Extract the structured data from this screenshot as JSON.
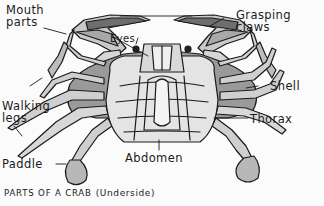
{
  "diagram": {
    "title": "PARTS OF A CRAB",
    "subtitle": "(Underside)",
    "labels": [
      {
        "id": "mouth-parts",
        "line1": "Mouth",
        "line2": "parts"
      },
      {
        "id": "eyes",
        "line1": "Eyes"
      },
      {
        "id": "grasping-claws",
        "line1": "Grasping",
        "line2": "claws"
      },
      {
        "id": "shell",
        "line1": "Shell"
      },
      {
        "id": "walking-legs",
        "line1": "Walking",
        "line2": "legs"
      },
      {
        "id": "thorax",
        "line1": "Thorax"
      },
      {
        "id": "paddle",
        "line1": "Paddle"
      },
      {
        "id": "abdomen",
        "line1": "Abdomen"
      }
    ],
    "colors": {
      "background": "#fbfbfb",
      "ink": "#1a1a1a",
      "shell_shade": "#9a9a9a",
      "body_light": "#e4e4e4",
      "leg_mid": "#c8c8c8"
    }
  }
}
